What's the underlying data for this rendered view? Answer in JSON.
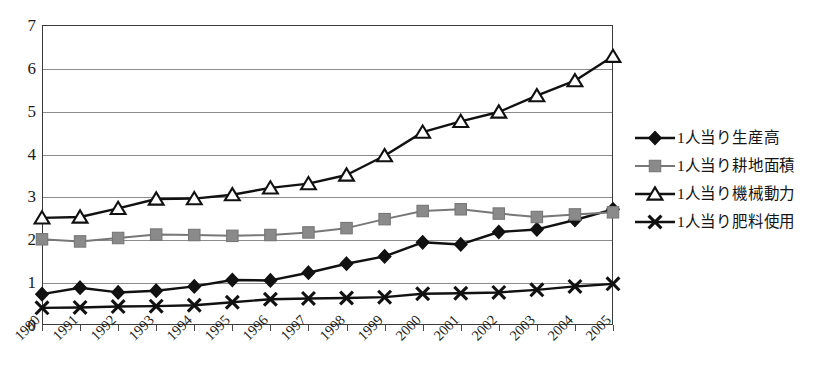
{
  "chart_data": {
    "type": "line",
    "title": "",
    "subtitle": "",
    "xlabel": "",
    "ylabel": "",
    "ylim": [
      0,
      7
    ],
    "ytick_labels": [
      "0",
      "1",
      "2",
      "3",
      "4",
      "5",
      "6",
      "7"
    ],
    "yticks": [
      0,
      1,
      2,
      3,
      4,
      5,
      6,
      7
    ],
    "grid": true,
    "grid_axis": "y",
    "legend_position": "right",
    "categories": [
      "1990",
      "1991",
      "1992",
      "1993",
      "1994",
      "1995",
      "1996",
      "1997",
      "1998",
      "1999",
      "2000",
      "2001",
      "2002",
      "2003",
      "2004",
      "2005"
    ],
    "series": [
      {
        "name": "1人当り生産高",
        "marker": "diamond",
        "color": "#111111",
        "marker_fill": "#111111",
        "values": [
          0.72,
          0.87,
          0.76,
          0.8,
          0.9,
          1.05,
          1.04,
          1.22,
          1.43,
          1.6,
          1.93,
          1.88,
          2.17,
          2.23,
          2.45,
          2.7
        ]
      },
      {
        "name": "1人当り耕地面積",
        "marker": "square",
        "color": "#777777",
        "marker_fill": "#8a8a8a",
        "values": [
          2.0,
          1.95,
          2.03,
          2.11,
          2.1,
          2.08,
          2.1,
          2.16,
          2.26,
          2.47,
          2.66,
          2.7,
          2.6,
          2.52,
          2.58,
          2.63
        ]
      },
      {
        "name": "1人当り機械動力",
        "marker": "triangle",
        "color": "#111111",
        "marker_fill": "#ffffff",
        "values": [
          2.5,
          2.52,
          2.72,
          2.94,
          2.95,
          3.04,
          3.2,
          3.3,
          3.5,
          3.95,
          4.5,
          4.75,
          4.97,
          5.35,
          5.7,
          6.27
        ]
      },
      {
        "name": "1人当り肥料使用",
        "marker": "x",
        "color": "#111111",
        "marker_fill": "#111111",
        "values": [
          0.4,
          0.41,
          0.43,
          0.44,
          0.46,
          0.53,
          0.6,
          0.62,
          0.63,
          0.65,
          0.73,
          0.74,
          0.76,
          0.82,
          0.9,
          0.96
        ]
      }
    ]
  },
  "legend": {
    "items": [
      {
        "label": "1人当り生産高",
        "marker": "diamond"
      },
      {
        "label": "1人当り耕地面積",
        "marker": "square"
      },
      {
        "label": "1人当り機械動力",
        "marker": "triangle"
      },
      {
        "label": "1人当り肥料使用",
        "marker": "x"
      }
    ]
  },
  "caption": {
    "text": ""
  }
}
